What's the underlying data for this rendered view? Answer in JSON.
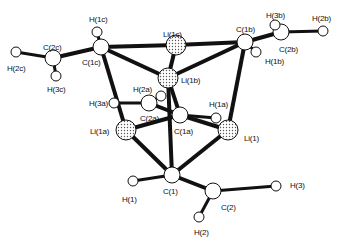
{
  "diagram": {
    "type": "molecular-structure",
    "atoms": [
      {
        "id": "Li1c",
        "label": "Li(1c)",
        "el": "Li",
        "x": 176,
        "y": 45,
        "lx": 163,
        "ly": 30
      },
      {
        "id": "Li1b",
        "label": "Li(1b)",
        "el": "Li",
        "x": 168,
        "y": 78,
        "lx": 181,
        "ly": 76
      },
      {
        "id": "Li1a",
        "label": "Li(1a)",
        "el": "Li",
        "x": 126,
        "y": 130,
        "lx": 90,
        "ly": 127
      },
      {
        "id": "Li1",
        "label": "Li(1)",
        "el": "Li",
        "x": 228,
        "y": 130,
        "lx": 244,
        "ly": 134
      },
      {
        "id": "C1c",
        "label": "C(1c)",
        "el": "C",
        "x": 101,
        "y": 47,
        "lx": 82,
        "ly": 58
      },
      {
        "id": "C1b",
        "label": "C(1b)",
        "el": "C",
        "x": 245,
        "y": 42,
        "lx": 236,
        "ly": 25
      },
      {
        "id": "C1a",
        "label": "C(1a)",
        "el": "C",
        "x": 180,
        "y": 115,
        "lx": 174,
        "ly": 127
      },
      {
        "id": "C2a",
        "label": "C(2a)",
        "el": "C",
        "x": 149,
        "y": 103,
        "lx": 140,
        "ly": 114
      },
      {
        "id": "C1",
        "label": "C(1)",
        "el": "C",
        "x": 172,
        "y": 175,
        "lx": 163,
        "ly": 187
      },
      {
        "id": "C2",
        "label": "C(2)",
        "el": "C",
        "x": 213,
        "y": 191,
        "lx": 221,
        "ly": 203
      },
      {
        "id": "C2c",
        "label": "C(2c)",
        "el": "C",
        "x": 53,
        "y": 58,
        "lx": 43,
        "ly": 43
      },
      {
        "id": "C2b",
        "label": "C(2b)",
        "el": "C",
        "x": 281,
        "y": 32,
        "lx": 279,
        "ly": 45
      },
      {
        "id": "H1c",
        "label": "H(1c)",
        "el": "H",
        "x": 97,
        "y": 32,
        "lx": 89,
        "ly": 15
      },
      {
        "id": "H2c",
        "label": "H(2c)",
        "el": "H",
        "x": 16,
        "y": 52,
        "lx": 7,
        "ly": 64
      },
      {
        "id": "H3c",
        "label": "H(3c)",
        "el": "H",
        "x": 56,
        "y": 76,
        "lx": 47,
        "ly": 85
      },
      {
        "id": "H3b",
        "label": "H(3b)",
        "el": "H",
        "x": 275,
        "y": 25,
        "lx": 266,
        "ly": 11
      },
      {
        "id": "H2b",
        "label": "H(2b)",
        "el": "H",
        "x": 323,
        "y": 31,
        "lx": 312,
        "ly": 14
      },
      {
        "id": "H1b",
        "label": "H(1b)",
        "el": "H",
        "x": 256,
        "y": 52,
        "lx": 265,
        "ly": 57
      },
      {
        "id": "H2a",
        "label": "H(2a)",
        "el": "H",
        "x": 161,
        "y": 96,
        "lx": 133,
        "ly": 85
      },
      {
        "id": "H3a",
        "label": "H(3a)",
        "el": "H",
        "x": 114,
        "y": 103,
        "lx": 89,
        "ly": 99
      },
      {
        "id": "H1a",
        "label": "H(1a)",
        "el": "H",
        "x": 216,
        "y": 118,
        "lx": 209,
        "ly": 100
      },
      {
        "id": "H1",
        "label": "H(1)",
        "el": "H",
        "x": 133,
        "y": 181,
        "lx": 122,
        "ly": 195
      },
      {
        "id": "H3",
        "label": "H(3)",
        "el": "H",
        "x": 276,
        "y": 186,
        "lx": 290,
        "ly": 181
      },
      {
        "id": "H2",
        "label": "H(2)",
        "el": "H",
        "x": 199,
        "y": 217,
        "lx": 194,
        "ly": 228
      }
    ],
    "bonds": [
      [
        "C1c",
        "Li1c"
      ],
      [
        "C1c",
        "Li1b"
      ],
      [
        "C1c",
        "Li1a"
      ],
      [
        "C1c",
        "C2c"
      ],
      [
        "C1c",
        "H1c"
      ],
      [
        "C2c",
        "H2c"
      ],
      [
        "C2c",
        "H3c"
      ],
      [
        "C1b",
        "Li1c"
      ],
      [
        "C1b",
        "Li1b"
      ],
      [
        "C1b",
        "Li1"
      ],
      [
        "C1b",
        "C2b"
      ],
      [
        "C1b",
        "H1b"
      ],
      [
        "C2b",
        "H3b"
      ],
      [
        "C2b",
        "H2b"
      ],
      [
        "Li1c",
        "Li1b"
      ],
      [
        "C1a",
        "Li1b"
      ],
      [
        "C1a",
        "Li1a"
      ],
      [
        "C1a",
        "Li1"
      ],
      [
        "C1a",
        "C2a"
      ],
      [
        "C1a",
        "H1a"
      ],
      [
        "C2a",
        "H2a"
      ],
      [
        "C2a",
        "H3a"
      ],
      [
        "C1",
        "Li1b"
      ],
      [
        "C1",
        "Li1a"
      ],
      [
        "C1",
        "Li1"
      ],
      [
        "C1",
        "C2"
      ],
      [
        "C1",
        "H1"
      ],
      [
        "C2",
        "H2"
      ],
      [
        "C2",
        "H3"
      ]
    ]
  },
  "colors": {
    "bond": "#111111",
    "atom_fill": "#ffffff",
    "li_fill": "#d8d8d8",
    "outline": "#111111"
  }
}
